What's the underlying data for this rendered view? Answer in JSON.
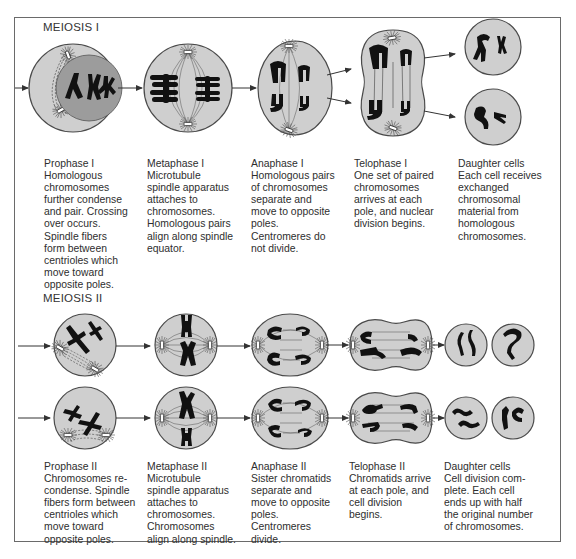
{
  "sections": {
    "meiosis1": {
      "title": "MEIOSIS I"
    },
    "meiosis2": {
      "title": "MEIOSIS II"
    }
  },
  "colors": {
    "cell_fill": "#cfcfcf",
    "cell_stroke": "#4a4a4a",
    "nucleus_fill": "#9c9c9c",
    "chromosome": "#111111",
    "arrow": "#333333",
    "frame": "#6a6a6a"
  },
  "meiosis1_stages": [
    {
      "name": "Prophase I",
      "lines": [
        "Prophase I",
        "Homologous",
        "chromosomes",
        "further condense",
        "and pair. Crossing",
        "over occurs.",
        "Spindle fibers",
        "form between",
        "centrioles which",
        "move toward",
        "opposite poles."
      ]
    },
    {
      "name": "Metaphase I",
      "lines": [
        "Metaphase I",
        "Microtubule",
        "spindle apparatus",
        "attaches to",
        "chromosomes.",
        "Homologous pairs",
        "align along spindle",
        "equator."
      ]
    },
    {
      "name": "Anaphase I",
      "lines": [
        "Anaphase I",
        "Homologous pairs",
        "of chromosomes",
        "separate and",
        "move to opposite",
        "poles.",
        "Centromeres do",
        "not divide."
      ]
    },
    {
      "name": "Telophase I",
      "lines": [
        "Telophase I",
        "One set of paired",
        "chromosomes",
        "arrives at each",
        "pole, and nuclear",
        "division begins."
      ]
    },
    {
      "name": "Daughter cells",
      "lines": [
        "Daughter cells",
        "Each cell receives",
        "exchanged",
        "chromosomal",
        "material from",
        "homologous",
        "chromosomes."
      ]
    }
  ],
  "meiosis2_stages": [
    {
      "name": "Prophase II",
      "lines": [
        "Prophase II",
        "Chromosomes re-",
        "condense. Spindle",
        "fibers form between",
        "centrioles which",
        "move toward",
        "opposite poles."
      ]
    },
    {
      "name": "Metaphase II",
      "lines": [
        "Metaphase II",
        "Microtubule",
        "spindle apparatus",
        "attaches to",
        "chromosomes.",
        "Chromosomes",
        "align along spindle."
      ]
    },
    {
      "name": "Anaphase II",
      "lines": [
        "Anaphase II",
        "Sister chromatids",
        "separate and",
        "move to opposite",
        "poles.",
        "Centromeres",
        "divide."
      ]
    },
    {
      "name": "Telophase II",
      "lines": [
        "Telophase II",
        "Chromatids arrive",
        "at each pole, and",
        "cell division",
        "begins."
      ]
    },
    {
      "name": "Daughter cells",
      "lines": [
        "Daughter cells",
        "Cell division com-",
        "plete. Each cell",
        "ends up with half",
        "the original number",
        "of chromosomes."
      ]
    }
  ]
}
